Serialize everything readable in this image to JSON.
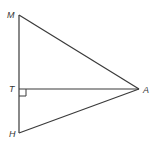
{
  "diagram": {
    "type": "geometry-figure",
    "colors": {
      "stroke": "#3a3a3a",
      "label": "#333333",
      "background": "#ffffff"
    },
    "points": {
      "M": {
        "label": "M",
        "x": 19,
        "y": 15
      },
      "T": {
        "label": "T",
        "x": 19,
        "y": 89
      },
      "H": {
        "label": "H",
        "x": 19,
        "y": 133
      },
      "A": {
        "label": "A",
        "x": 139,
        "y": 89
      }
    },
    "segments": [
      {
        "from": "M",
        "to": "H",
        "name": "MH"
      },
      {
        "from": "M",
        "to": "A",
        "name": "MA"
      },
      {
        "from": "T",
        "to": "A",
        "name": "TA"
      },
      {
        "from": "H",
        "to": "A",
        "name": "HA"
      }
    ],
    "right_angle_marker": {
      "at": "T",
      "between": [
        "TA",
        "TH"
      ],
      "size": 7
    },
    "labels": {
      "M": "M",
      "T": "T",
      "H": "H",
      "A": "A"
    }
  }
}
